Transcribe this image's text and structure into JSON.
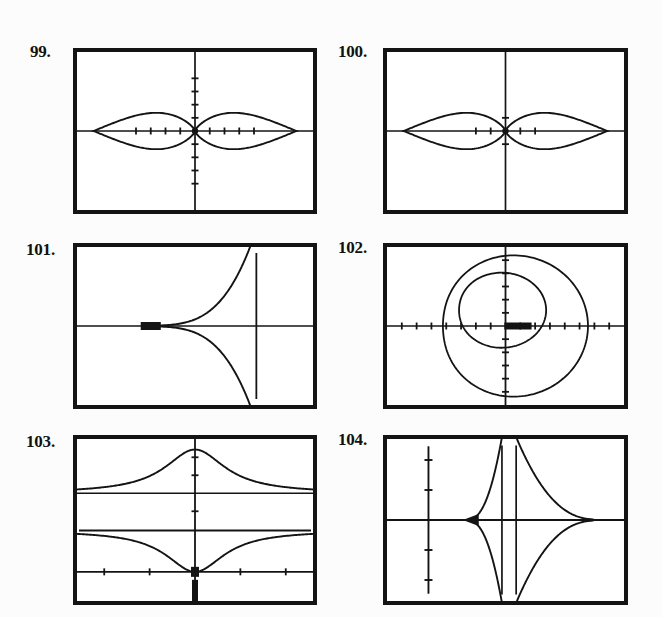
{
  "page": {
    "background_color": "#fcfcfc",
    "ink_color": "#141414"
  },
  "problems": [
    {
      "number": "99.",
      "label_x": 30,
      "label_y": 42,
      "screen": {
        "x": 73,
        "y": 48,
        "w": 244,
        "h": 166
      },
      "chart_data": {
        "type": "line",
        "title": "Polar rose: four-petal / lemniscate-type two-lobe curve",
        "kind": "polar-two-lobe",
        "axes": {
          "origin_frac_x": 0.5,
          "origin_frac_y": 0.5,
          "x_axis": true,
          "y_axis": true
        },
        "xticks_count_left": 4,
        "xticks_count_right": 4,
        "yticks_count_up": 4,
        "yticks_count_down": 4,
        "grid": false,
        "legend": "none",
        "lobes": [
          {
            "side": "left",
            "cx_frac": -0.21,
            "rx_frac": 0.205,
            "ry_frac": 0.115
          },
          {
            "side": "right",
            "cx_frac": 0.21,
            "rx_frac": 0.205,
            "ry_frac": 0.115
          }
        ],
        "xlabel": "",
        "ylabel": ""
      }
    },
    {
      "number": "100.",
      "label_x": 338,
      "label_y": 42,
      "screen": {
        "x": 383,
        "y": 48,
        "w": 245,
        "h": 166
      },
      "chart_data": {
        "type": "line",
        "title": "Polar two-lobe curve with sparse axis ticks",
        "kind": "polar-two-lobe",
        "axes": {
          "origin_frac_x": 0.5,
          "origin_frac_y": 0.5,
          "x_axis": true,
          "y_axis": true
        },
        "xticks_count_left": 2,
        "xticks_count_right": 2,
        "yticks_count_up": 1,
        "yticks_count_down": 1,
        "grid": false,
        "legend": "none",
        "lobes": [
          {
            "side": "left",
            "cx_frac": -0.185,
            "rx_frac": 0.18,
            "ry_frac": 0.115
          },
          {
            "side": "right",
            "cx_frac": 0.185,
            "rx_frac": 0.18,
            "ry_frac": 0.115
          }
        ],
        "xlabel": "",
        "ylabel": ""
      }
    },
    {
      "number": "101.",
      "label_x": 26,
      "label_y": 240,
      "screen": {
        "x": 73,
        "y": 243,
        "w": 244,
        "h": 166
      },
      "chart_data": {
        "type": "line",
        "title": "Curve opening rightward with vertical asymptote",
        "kind": "sideways-hyperbolic",
        "axes": {
          "origin_frac_x": -0.25,
          "origin_frac_y": 0.5,
          "x_axis": true,
          "y_axis": true
        },
        "xticks_count_left": 0,
        "xticks_count_right": 2,
        "yticks_count_up": 6,
        "yticks_count_down": 6,
        "asymptote_frac_x": 0.38,
        "vertex_frac_x": -0.11,
        "grid": false,
        "legend": "none",
        "xlabel": "",
        "ylabel": ""
      }
    },
    {
      "number": "102.",
      "label_x": 338,
      "label_y": 238,
      "screen": {
        "x": 383,
        "y": 243,
        "w": 245,
        "h": 166
      },
      "chart_data": {
        "type": "line",
        "title": "Two nested limacon / spiral curves",
        "kind": "nested-limacons",
        "axes": {
          "origin_frac_x": 0.1,
          "origin_frac_y": 0.5,
          "x_axis": true,
          "y_axis": true
        },
        "xticks_count_left": 8,
        "xticks_count_right": 8,
        "yticks_count_up": 5,
        "yticks_count_down": 9,
        "grid": false,
        "legend": "none",
        "curves": [
          {
            "name": "outer-spiral",
            "rx_frac": 0.33,
            "ry_frac": 0.44
          },
          {
            "name": "inner-loop",
            "rx_frac": 0.2,
            "ry_frac": 0.22
          }
        ],
        "xlabel": "",
        "ylabel": ""
      }
    },
    {
      "number": "103.",
      "label_x": 26,
      "label_y": 432,
      "screen": {
        "x": 73,
        "y": 435,
        "w": 244,
        "h": 170
      },
      "chart_data": {
        "type": "line",
        "title": "Bell-shaped peak, horizontal line, and inverted cusp above lower axis",
        "kind": "bell-and-cusp",
        "axes": {
          "origin_frac_x": 0.5,
          "origin_frac_y": 0.82,
          "x_axis": true,
          "y_axis": true
        },
        "xticks_count_left": 2,
        "xticks_count_right": 2,
        "yticks_count_up": 3,
        "yticks_count_down": 2,
        "grid": false,
        "legend": "none",
        "curves": [
          {
            "name": "bell-peak",
            "baseline_frac_y": 0.33,
            "peak_frac_y": 0.06
          },
          {
            "name": "horizontal-line",
            "frac_y": 0.56
          },
          {
            "name": "inverted-cusp",
            "baseline_frac_y": 0.56,
            "cusp_frac_y": 0.81
          }
        ],
        "xlabel": "",
        "ylabel": ""
      }
    },
    {
      "number": "104.",
      "label_x": 338,
      "label_y": 430,
      "screen": {
        "x": 383,
        "y": 435,
        "w": 245,
        "h": 170
      },
      "chart_data": {
        "type": "line",
        "title": "Diamond-shaped curve with twin vertical asymptotes",
        "kind": "vertical-asymptote-diamond",
        "axes": {
          "origin_frac_x": 0.5,
          "origin_frac_y": 0.5,
          "x_axis": true,
          "y_axis": true
        },
        "xticks_count_left": 0,
        "xticks_count_right": 0,
        "yticks_count_up": 2,
        "yticks_count_down": 2,
        "y_axis_frac_x": -0.33,
        "asymptotes_frac_x": [
          -0.03,
          0.04
        ],
        "left_vertex_frac_x": -0.16,
        "right_vertex_frac_x": 0.3,
        "grid": false,
        "legend": "none",
        "xlabel": "",
        "ylabel": ""
      }
    }
  ]
}
